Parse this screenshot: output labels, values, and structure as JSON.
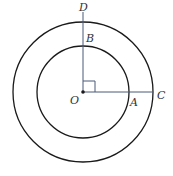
{
  "diagram": {
    "type": "concentric-circles",
    "center": {
      "label": "O",
      "x": 83,
      "y": 92
    },
    "outer_circle": {
      "r": 70
    },
    "inner_circle": {
      "r": 46
    },
    "points": {
      "D": {
        "label": "D"
      },
      "B": {
        "label": "B"
      },
      "A": {
        "label": "A"
      },
      "C": {
        "label": "C"
      },
      "O": {
        "label": "O"
      }
    },
    "right_angle_marker": true,
    "colors": {
      "circle": "#1a1a1a",
      "radius_line": "#4a5a7a"
    }
  }
}
